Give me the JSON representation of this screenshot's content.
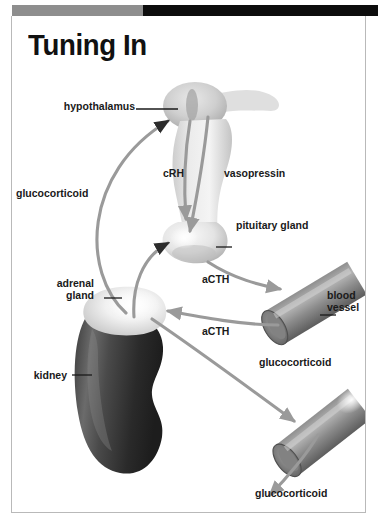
{
  "page": {
    "title": "Tuning In",
    "accent_gray": "#8e8e8e",
    "accent_black": "#0d0d0d",
    "frame_color": "#b9b9b9",
    "background": "#ffffff"
  },
  "diagram": {
    "type": "anatomical-flow-diagram",
    "structures": [
      {
        "name": "hypothalamus",
        "label": "hypothalamus"
      },
      {
        "name": "pituitary-gland",
        "label": "pituitary gland"
      },
      {
        "name": "adrenal-gland",
        "label": "adrenal\ngland"
      },
      {
        "name": "kidney",
        "label": "kidney"
      },
      {
        "name": "blood-vessel-upper",
        "label": "blood\nvessel"
      },
      {
        "name": "blood-vessel-lower",
        "label": ""
      }
    ],
    "hormone_labels": [
      {
        "name": "crh",
        "label": "cRH"
      },
      {
        "name": "vasopressin",
        "label": "vasopressin"
      },
      {
        "name": "acth-upper",
        "label": "aCTH"
      },
      {
        "name": "acth-lower",
        "label": "aCTH"
      },
      {
        "name": "glucocorticoid-feedback",
        "label": "glucocorticoid"
      },
      {
        "name": "glucocorticoid-release",
        "label": "glucocorticoid"
      },
      {
        "name": "glucocorticoid-outflow",
        "label": "glucocorticoid"
      }
    ],
    "labels": {
      "hypothalamus": "hypothalamus",
      "crh": "cRH",
      "vasopressin": "vasopressin",
      "glucocorticoid_left": "glucocorticoid",
      "pituitary_gland": "pituitary gland",
      "adrenal_gland_line1": "adrenal",
      "adrenal_gland_line2": "gland",
      "acth_upper": "aCTH",
      "acth_lower": "aCTH",
      "blood_vessel_line1": "blood",
      "blood_vessel_line2": "vessel",
      "kidney": "kidney",
      "glucocorticoid_right": "glucocorticoid",
      "glucocorticoid_bottom": "glucocorticoid"
    }
  }
}
